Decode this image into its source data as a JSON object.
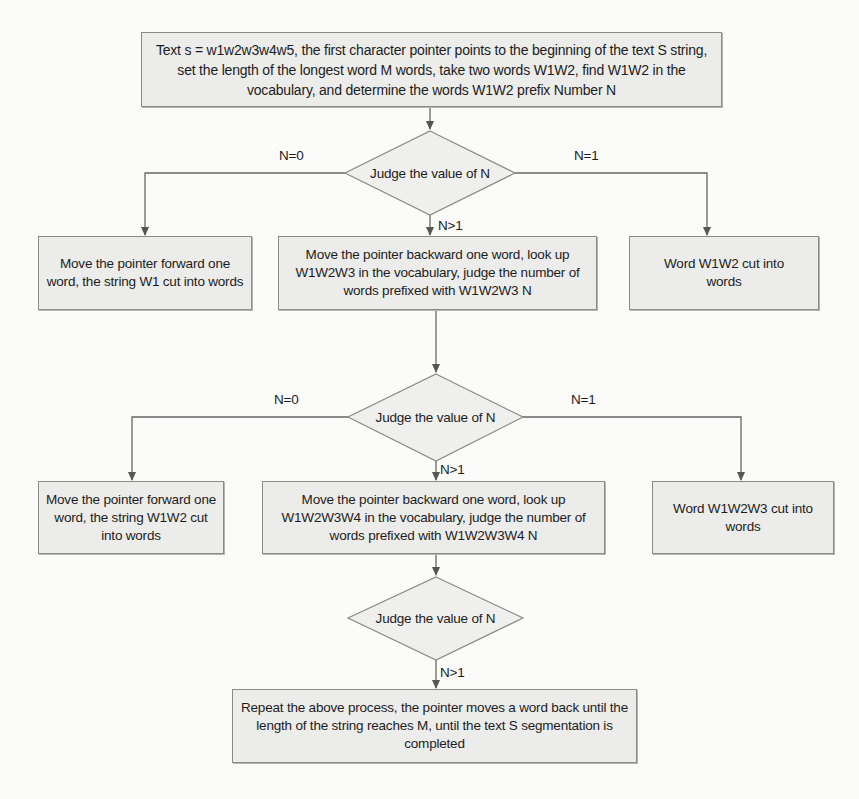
{
  "flowchart": {
    "start": {
      "text": "Text s = w1w2w3w4w5, the first character pointer points to the beginning of the text S string, set the length of the longest word M words, take two words W1W2, find W1W2 in the vocabulary, and determine the words W1W2 prefix Number N"
    },
    "decision1": {
      "text": "Judge the value of N",
      "branch_left": "N=0",
      "branch_right": "N=1",
      "branch_down": "N>1"
    },
    "row1": {
      "left": "Move the pointer forward one word, the string W1 cut into words",
      "center": "Move the pointer backward one word, look up W1W2W3 in the vocabulary, judge the number of words prefixed with W1W2W3 N",
      "right": "Word W1W2 cut into words"
    },
    "decision2": {
      "text": "Judge the value of N",
      "branch_left": "N=0",
      "branch_right": "N=1",
      "branch_down": "N>1"
    },
    "row2": {
      "left": "Move the pointer forward one word, the string W1W2 cut into words",
      "center": "Move the pointer backward one word, look up W1W2W3W4 in the vocabulary, judge the number of words prefixed with W1W2W3W4 N",
      "right": "Word W1W2W3 cut into words"
    },
    "decision3": {
      "text": "Judge the value of N",
      "branch_down": "N>1"
    },
    "end": {
      "text": "Repeat the above process, the pointer moves a word back until the length of the string reaches M, until the text S segmentation is completed"
    }
  },
  "colors": {
    "box_fill": "#ececea",
    "box_border": "#8a8a8a",
    "line": "#555555",
    "background": "#fbfbf9"
  }
}
